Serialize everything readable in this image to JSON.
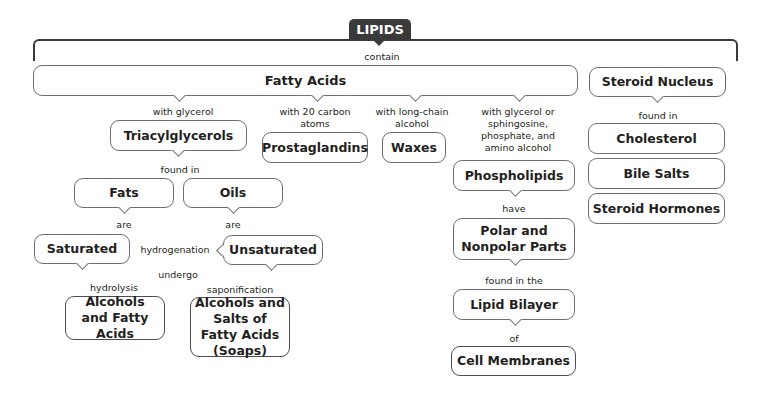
{
  "title": "LIPIDS",
  "links": {
    "contain": "contain",
    "with_glycerol": "with glycerol",
    "with_20_carbon": "with 20 carbon atoms",
    "with_long_chain": "with long-chain alcohol",
    "with_glycerol_sphingosine": "with glycerol or sphingosine, phosphate, and amino alcohol",
    "found_in_tri": "found in",
    "are_fats": "are",
    "are_oils": "are",
    "hydrogenation": "hydrogenation",
    "undergo": "undergo",
    "hydrolysis": "hydrolysis",
    "saponification": "saponification",
    "have": "have",
    "found_in_the": "found in the",
    "of": "of",
    "found_in_steroid": "found in"
  },
  "nodes": {
    "fatty_acids": "Fatty Acids",
    "steroid_nucleus": "Steroid Nucleus",
    "triacylglycerols": "Triacylglycerols",
    "prostaglandins": "Prostaglandins",
    "waxes": "Waxes",
    "phospholipids": "Phospholipids",
    "cholesterol": "Cholesterol",
    "bile_salts": "Bile Salts",
    "steroid_hormones": "Steroid Hormones",
    "fats": "Fats",
    "oils": "Oils",
    "saturated": "Saturated",
    "unsaturated": "Unsaturated",
    "alcohols_fatty_acids": "Alcohols and Fatty Acids",
    "alcohols_salts": "Alcohols and Salts of Fatty Acids (Soaps)",
    "polar_nonpolar": "Polar and Nonpolar Parts",
    "lipid_bilayer": "Lipid Bilayer",
    "cell_membranes": "Cell Membranes"
  }
}
